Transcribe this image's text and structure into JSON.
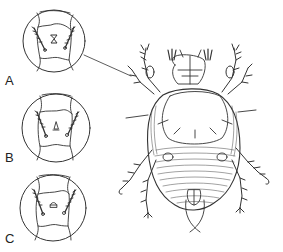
{
  "figure": {
    "insets": [
      {
        "label": "A",
        "center_glyph": "Σ-shaped (hourglass) structure"
      },
      {
        "label": "B",
        "center_glyph": "small bell / triangular structure"
      },
      {
        "label": "C",
        "center_glyph": "round dome structure"
      }
    ],
    "leader_line": "connects inset A to the mite's anterior region",
    "colors": {
      "ink": "#333333",
      "background": "#ffffff"
    }
  }
}
